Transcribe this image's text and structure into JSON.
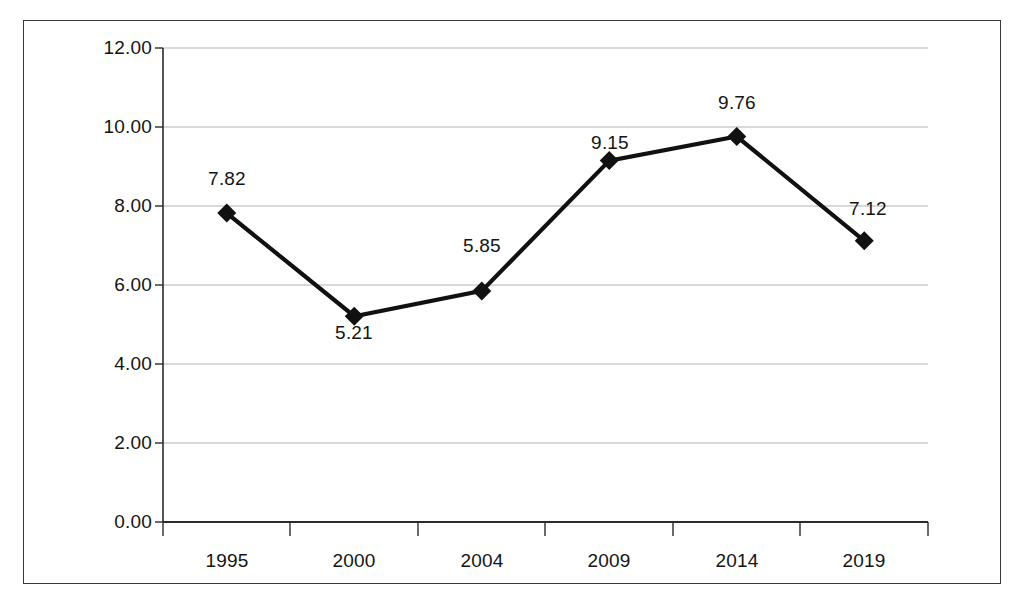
{
  "chart_data": {
    "type": "line",
    "title": "",
    "subtitle": "",
    "xlabel": "",
    "ylabel": "",
    "categories": [
      "1995",
      "2000",
      "2004",
      "2009",
      "2014",
      "2019"
    ],
    "values": [
      7.82,
      5.21,
      5.85,
      9.15,
      9.76,
      7.12
    ],
    "point_labels": [
      "7.82",
      "5.21",
      "5.85",
      "9.15",
      "9.76",
      "7.12"
    ],
    "point_label_positions": [
      "above",
      "below",
      "above",
      "above",
      "above",
      "above"
    ],
    "series": [
      {
        "name": "",
        "values": [
          7.82,
          5.21,
          5.85,
          9.15,
          9.76,
          7.12
        ]
      }
    ],
    "ylim": [
      0.0,
      12.0
    ],
    "ytick_labels": [
      "12.00",
      "10.00",
      "8.00",
      "6.00",
      "4.00",
      "2.00",
      "0.00"
    ],
    "ytick_values": [
      12.0,
      10.0,
      8.0,
      6.0,
      4.0,
      2.0,
      0.0
    ],
    "xtick_labels": [
      "1995",
      "2000",
      "2004",
      "2009",
      "2014",
      "2019"
    ],
    "grid": "horizontal",
    "legend": "none",
    "legend_position": "none",
    "marker": "diamond",
    "colors": {
      "line": "#111111",
      "marker": "#111111",
      "gridline": "#b4b4b4",
      "axis": "#2b2b2b",
      "frame": "#3a3a3a",
      "background": "#ffffff",
      "text": "#141414"
    }
  }
}
